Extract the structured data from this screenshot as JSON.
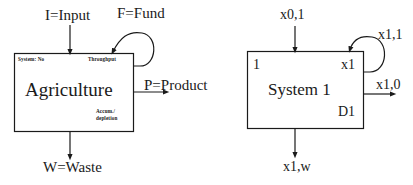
{
  "figure": {
    "background_color": "#ffffff",
    "ink_color": "#1a1a1a",
    "panels": [
      {
        "id": "agriculture-system",
        "box_label": "Agriculture",
        "corner_labels": {
          "top_left": "System: No",
          "top_right": "Throughput",
          "bottom_right_line1": "Accum./",
          "bottom_right_line2": "depletion"
        },
        "flows": [
          {
            "name": "input",
            "label": "I=Input",
            "direction": "down-into-top-left"
          },
          {
            "name": "fund",
            "label": "F=Fund",
            "direction": "feedback-loop-right-to-top"
          },
          {
            "name": "product",
            "label": "P=Product",
            "direction": "right-out"
          },
          {
            "name": "waste",
            "label": "W=Waste",
            "direction": "down-out-bottom"
          }
        ]
      },
      {
        "id": "system-1",
        "box_label": "System 1",
        "corner_labels": {
          "top_left": "1",
          "top_right": "x1",
          "bottom_right": "D1"
        },
        "flows": [
          {
            "name": "input",
            "label": "x0,1",
            "direction": "down-into-top-left"
          },
          {
            "name": "feedback",
            "label": "x1,1",
            "direction": "feedback-loop-right-to-top"
          },
          {
            "name": "output",
            "label": "x1,0",
            "direction": "right-out"
          },
          {
            "name": "waste",
            "label": "x1,w",
            "direction": "down-out-bottom"
          }
        ]
      }
    ]
  }
}
